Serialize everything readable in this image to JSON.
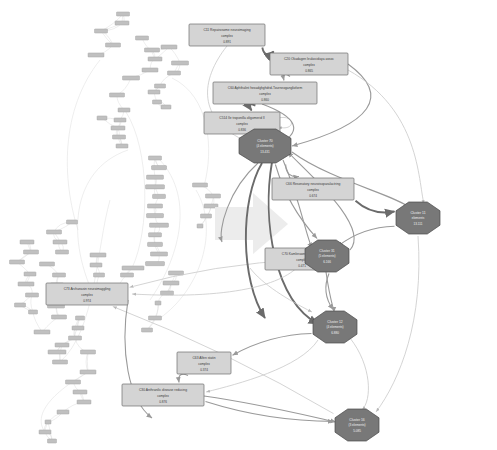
{
  "figure": {
    "background_color": "#ffffff",
    "width": 497,
    "height": 450
  },
  "arrow": {
    "name": "transformation-arrow",
    "direction": "right",
    "color": "#ececec"
  },
  "left_panel": {
    "name": "source-interaction-network",
    "description": "Dense unclustered protein interaction network",
    "node_fill": "#c0c0c0",
    "edge_color": "#dcdcdc",
    "node_count": 86
  },
  "right_panel": {
    "name": "clustered-complex-network",
    "description": "Reduced network of complexes and clusters",
    "complex_fill": "#d4d4d4",
    "cluster_fill": "#787878"
  },
  "chart_data": {
    "type": "diagram",
    "graph_kind": "directed-graph",
    "legend_position": "none",
    "complexes": [
      {
        "id": "C11",
        "label": "C11 Repairosome neuroimaging",
        "subtitle": "complex",
        "value": "0.891",
        "x": 189,
        "y": 24,
        "w": 76,
        "h": 22
      },
      {
        "id": "C20",
        "label": "C20 Okadagen leukocidaya assoc",
        "subtitle": "complex",
        "value": "0.865",
        "x": 270,
        "y": 53,
        "w": 78,
        "h": 22
      },
      {
        "id": "C60",
        "label": "C60 Aphthalint hexadghghdrid-Tourneoganglioform",
        "subtitle": "complex",
        "value": "0.860",
        "x": 213,
        "y": 82,
        "w": 104,
        "h": 22
      },
      {
        "id": "C514",
        "label": "C514 Ile troponilla oligomerid II",
        "subtitle": "complex",
        "value": "0.836",
        "x": 204,
        "y": 112,
        "w": 76,
        "h": 22
      },
      {
        "id": "C66",
        "label": "C66 Resonatory neuroisoparalactring",
        "subtitle": "complex",
        "value": "0.674",
        "x": 272,
        "y": 178,
        "w": 82,
        "h": 22
      },
      {
        "id": "C70",
        "label": "C70 Kamlerawn prollogirine",
        "subtitle": "complex",
        "value": "0.471",
        "x": 265,
        "y": 248,
        "w": 74,
        "h": 22
      },
      {
        "id": "C73",
        "label": "C73 Archanasin neuroimaggling",
        "subtitle": "complex",
        "value": "0.974",
        "x": 46,
        "y": 283,
        "w": 82,
        "h": 22
      },
      {
        "id": "C63",
        "label": "C63 Alfen statin",
        "subtitle": "complex",
        "value": "0.374",
        "x": 177,
        "y": 352,
        "w": 54,
        "h": 22
      },
      {
        "id": "C30",
        "label": "C30 Anthranilic disease reducing",
        "subtitle": "complex",
        "value": "0.876",
        "x": 122,
        "y": 384,
        "w": 82,
        "h": 22
      }
    ],
    "clusters": [
      {
        "id": "Cluster 70",
        "label": "Cluster 70",
        "subtitle": "(4 elements)",
        "value": "13.431",
        "x": 265,
        "y": 146,
        "rx": 26,
        "ry": 17
      },
      {
        "id": "Cluster 11",
        "label": "Cluster 11",
        "subtitle": "elements",
        "value": "13.111",
        "x": 418,
        "y": 218,
        "rx": 22,
        "ry": 16
      },
      {
        "id": "Cluster 31",
        "label": "Cluster 31",
        "subtitle": "(5 elements)",
        "value": "6.166",
        "x": 327,
        "y": 256,
        "rx": 22,
        "ry": 16
      },
      {
        "id": "Cluster 12",
        "label": "Cluster 12",
        "subtitle": "(4 elements)",
        "value": "6.880",
        "x": 335,
        "y": 327,
        "rx": 22,
        "ry": 16
      },
      {
        "id": "Cluster 16",
        "label": "Cluster 16",
        "subtitle": "(3 elements)",
        "value": "5.085",
        "x": 357,
        "y": 425,
        "rx": 22,
        "ry": 16
      }
    ],
    "edges": [
      {
        "from": "C11",
        "to": "C20",
        "weight": "thick"
      },
      {
        "from": "C20",
        "to": "C60",
        "weight": "mid"
      },
      {
        "from": "C60",
        "to": "C514",
        "weight": "thick"
      },
      {
        "from": "C514",
        "to": "Cluster 70",
        "weight": "thick"
      },
      {
        "from": "Cluster 70",
        "to": "C66",
        "weight": "mid"
      },
      {
        "from": "C66",
        "to": "Cluster 11",
        "weight": "thick"
      },
      {
        "from": "Cluster 11",
        "to": "C70",
        "weight": "mid"
      },
      {
        "from": "Cluster 70",
        "to": "Cluster 31",
        "weight": "mid"
      },
      {
        "from": "Cluster 31",
        "to": "C73",
        "weight": "thin"
      },
      {
        "from": "Cluster 31",
        "to": "Cluster 12",
        "weight": "mid"
      },
      {
        "from": "Cluster 12",
        "to": "C63",
        "weight": "mid"
      },
      {
        "from": "C63",
        "to": "C30",
        "weight": "mid"
      },
      {
        "from": "C30",
        "to": "Cluster 16",
        "weight": "mid"
      },
      {
        "from": "Cluster 16",
        "to": "C73",
        "weight": "thin"
      },
      {
        "from": "C514",
        "to": "C514",
        "weight": "thin",
        "self_loop": true
      }
    ]
  }
}
